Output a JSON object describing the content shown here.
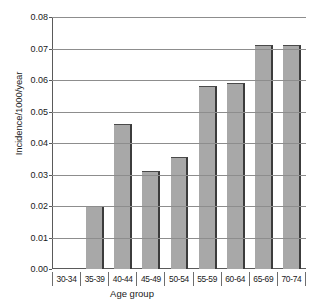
{
  "chart_data": {
    "type": "bar",
    "title": "",
    "xlabel": "Age group",
    "ylabel": "Incidence/1000/year",
    "categories": [
      "30-34",
      "35-39",
      "40-44",
      "45-49",
      "50-54",
      "55-59",
      "60-64",
      "65-69",
      "70-74"
    ],
    "values": [
      0,
      0.02,
      0.046,
      0.031,
      0.0355,
      0.058,
      0.059,
      0.0712,
      0.071
    ],
    "ylim": [
      0,
      0.08
    ],
    "ytick_labels": [
      "0.08",
      "0.07",
      "0.06",
      "0.05",
      "0.04",
      "0.03",
      "0.02",
      "0.01",
      "0.00"
    ],
    "ytick_values": [
      0.08,
      0.07,
      0.06,
      0.05,
      0.04,
      0.03,
      0.02,
      0.01,
      0.0
    ],
    "grid": "horizontal",
    "legend": "none",
    "bar_color": "#a8a8a8",
    "bar_edge_color": "#3c3c3c",
    "axis_color": "#5a5a5a",
    "grid_color": "#8d8d8d"
  }
}
